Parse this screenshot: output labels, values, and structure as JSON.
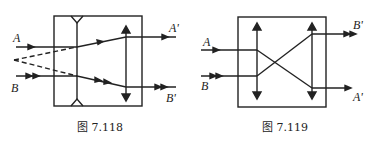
{
  "figures": [
    {
      "id": "fig-7-118",
      "caption": "图 7.118",
      "labels": {
        "in_top": "A",
        "in_bottom": "B",
        "out_top": "A'",
        "out_bottom": "B'"
      },
      "elements": [
        "concave-lens",
        "convex-lens",
        "box"
      ]
    },
    {
      "id": "fig-7-119",
      "caption": "图 7.119",
      "labels": {
        "in_top": "A",
        "in_bottom": "B",
        "out_top": "B'",
        "out_bottom": "A'"
      },
      "elements": [
        "convex-lens-left",
        "convex-lens-right",
        "box"
      ]
    }
  ]
}
